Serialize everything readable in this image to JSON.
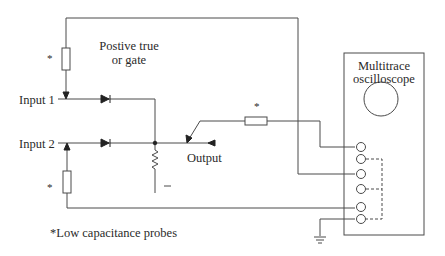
{
  "diagram": {
    "title_gate": [
      "Postive true",
      "or gate"
    ],
    "inputs": [
      "Input 1",
      "Input 2"
    ],
    "output_label": "Output",
    "instrument": [
      "Multitrace",
      "oscilloscope"
    ],
    "probe_marker": "*",
    "footnote": "*Low capacitance probes",
    "ground_sign": "_",
    "terminal_count": 6,
    "colors": {
      "line": "#4a4a4a",
      "text": "#2a2a2a",
      "background": "#ffffff"
    }
  }
}
